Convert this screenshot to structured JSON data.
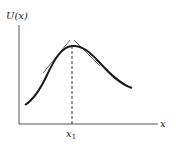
{
  "diagram": {
    "y_axis_label": "U(x)",
    "x_axis_label": "x",
    "marker_label_base": "x",
    "marker_label_sub": "1"
  },
  "colors": {
    "curve": "#1a1a1a",
    "axes": "#444444",
    "tangent": "#555555",
    "dashed": "#333333"
  }
}
